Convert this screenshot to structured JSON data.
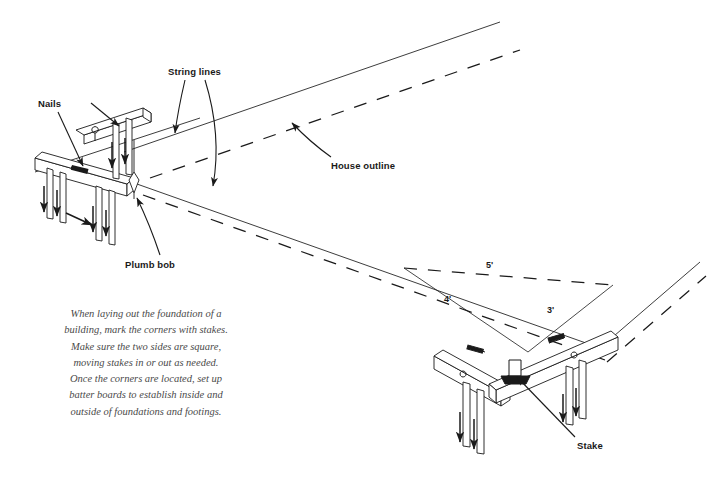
{
  "figure": {
    "background_color": "#ffffff",
    "ink_color": "#1a1a1a",
    "caption_color": "#4a4a4a"
  },
  "callouts": {
    "nails": "Nails",
    "string_lines": "String lines",
    "house_outline": "House outline",
    "plumb_bob": "Plumb bob",
    "stake": "Stake"
  },
  "dimensions": {
    "hypotenuse": "5'",
    "leg_left": "4'",
    "leg_right": "3'"
  },
  "caption": {
    "lines": [
      "When laying out the foundation of a",
      "building, mark the corners with stakes.",
      "Make sure the two sides are square,",
      "moving stakes in or out as needed.",
      "Once the corners are located, set up",
      "batter boards to establish inside and",
      "outside of foundations and footings."
    ]
  }
}
